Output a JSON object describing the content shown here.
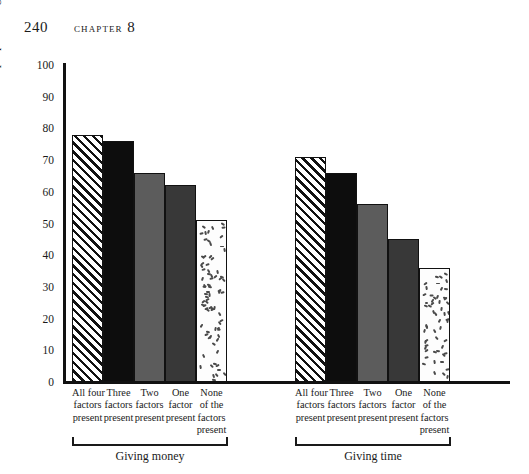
{
  "page": {
    "folio": "240",
    "chapter_label": "Chapter",
    "chapter_number": "8"
  },
  "chart_data": {
    "type": "bar",
    "title": "",
    "xlabel": "",
    "ylabel": "Percent of people willing to donate",
    "ylim": [
      0,
      100
    ],
    "yticks": [
      "0",
      "10",
      "20",
      "30",
      "40",
      "50",
      "60",
      "70",
      "80",
      "90",
      "100"
    ],
    "grid": false,
    "legend": "none",
    "categories": [
      [
        "All four",
        "factors",
        "present"
      ],
      [
        "Three",
        "factors",
        "present"
      ],
      [
        "Two",
        "factors",
        "present"
      ],
      [
        "One",
        "factor",
        "present"
      ],
      [
        "None",
        "of the",
        "factors",
        "present"
      ]
    ],
    "category_fills": [
      "hatch",
      "black",
      "gray",
      "dark-gray",
      "speckled"
    ],
    "groups": [
      {
        "name": "Giving money",
        "values": [
          78,
          76,
          66,
          62,
          51
        ]
      },
      {
        "name": "Giving time",
        "values": [
          71,
          66,
          56,
          45,
          36
        ]
      }
    ]
  }
}
